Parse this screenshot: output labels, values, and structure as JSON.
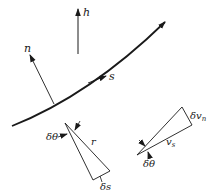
{
  "diagram": {
    "colors": {
      "line": "#1a1a1a",
      "background": "#ffffff"
    },
    "labels": {
      "h": "h",
      "n": "n",
      "s": "s",
      "left_triangle": {
        "angle": "δθ",
        "hypotenuse": "r",
        "base": "δs"
      },
      "right_triangle": {
        "side": "δv",
        "side_sub": "n",
        "long": "v",
        "long_sub": "s",
        "angle": "δθ"
      }
    }
  }
}
